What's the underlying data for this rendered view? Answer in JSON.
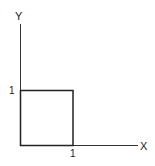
{
  "diagram": {
    "axes": {
      "x_label": "X",
      "y_label": "Y"
    },
    "ticks": {
      "x_tick": "1",
      "y_tick": "1"
    },
    "shape": {
      "type": "unit-square",
      "corners": [
        [
          0,
          0
        ],
        [
          1,
          0
        ],
        [
          1,
          1
        ],
        [
          0,
          1
        ]
      ]
    },
    "colors": {
      "stroke": "#222222",
      "background": "#ffffff"
    }
  }
}
